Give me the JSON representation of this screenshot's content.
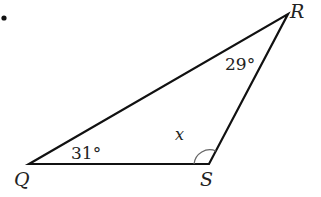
{
  "diagram": {
    "type": "triangle",
    "vertices": [
      {
        "name": "Q",
        "label": "Q"
      },
      {
        "name": "R",
        "label": "R"
      },
      {
        "name": "S",
        "label": "S"
      }
    ],
    "angles": {
      "Q": "31°",
      "R": "29°",
      "S": "x"
    },
    "bullet": "•",
    "colors": {
      "line": "#111111",
      "arc": "#666666",
      "text": "#222222"
    }
  }
}
